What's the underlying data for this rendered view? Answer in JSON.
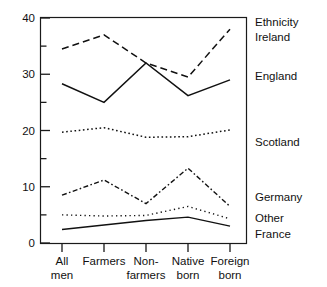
{
  "chart_data": {
    "type": "line",
    "title": "",
    "subtitle": "",
    "xlabel": "",
    "ylabel": "",
    "categories": [
      "All men",
      "Farmers",
      "Non-farmers",
      "Native born",
      "Foreign born"
    ],
    "category_lines": [
      [
        "All",
        "men"
      ],
      [
        "Farmers",
        ""
      ],
      [
        "Non-",
        "farmers"
      ],
      [
        "Native",
        "born"
      ],
      [
        "Foreign",
        "born"
      ]
    ],
    "ylim": [
      0,
      40
    ],
    "yticks": [
      0,
      10,
      20,
      30,
      40
    ],
    "ytick_labels": [
      "0",
      "10",
      "20",
      "30",
      "40"
    ],
    "yminorticks": [
      5,
      15,
      25,
      35
    ],
    "grid": false,
    "legend_position": "right",
    "legend_title": "Ethnicity",
    "series": [
      {
        "name": "Ireland",
        "style": "dashed",
        "values": [
          34.5,
          37.0,
          32.0,
          29.5,
          38.0
        ]
      },
      {
        "name": "England",
        "style": "solid",
        "values": [
          28.3,
          25.0,
          32.0,
          26.2,
          29.0
        ]
      },
      {
        "name": "Scotland",
        "style": "dotted",
        "values": [
          19.7,
          20.5,
          18.8,
          18.9,
          20.1
        ]
      },
      {
        "name": "Germany",
        "style": "dash-dot",
        "values": [
          8.5,
          11.2,
          7.0,
          13.3,
          6.5
        ]
      },
      {
        "name": "Other",
        "style": "fine-dotted",
        "values": [
          5.0,
          4.8,
          4.9,
          6.5,
          4.3
        ]
      },
      {
        "name": "France",
        "style": "solid-thin",
        "values": [
          2.4,
          3.2,
          4.0,
          4.6,
          3.0
        ]
      }
    ]
  },
  "axes": {
    "y_label_40": "40",
    "y_label_30": "30",
    "y_label_20": "20",
    "y_label_10": "10",
    "y_label_0": "0"
  },
  "legend": {
    "title": "Ethnicity",
    "entries": [
      "Ireland",
      "England",
      "Scotland",
      "Germany",
      "Other",
      "France"
    ]
  }
}
